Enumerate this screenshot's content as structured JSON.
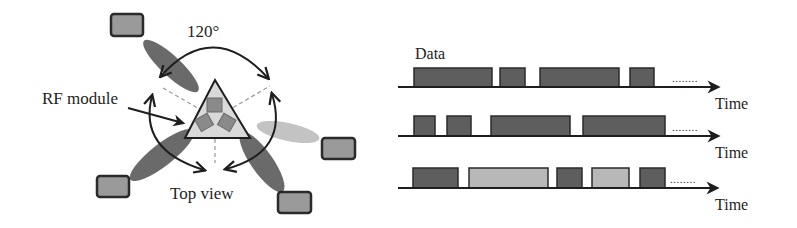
{
  "left_panel": {
    "angle_label": "120°",
    "rf_module_label": "RF module",
    "top_view_label": "Top view",
    "colors": {
      "beam_dark": "#5a5a5a",
      "beam_light": "#bdbdbd",
      "triangle_fill": "#d9d9d9",
      "module_fill": "#8a8a8a",
      "device_fill": "#9a9a9a",
      "stroke": "#1e1e1e"
    },
    "devices": [
      {
        "name": "top-left",
        "x": 111,
        "y": 14
      },
      {
        "name": "right",
        "x": 322,
        "y": 138
      },
      {
        "name": "bottom-left",
        "x": 97,
        "y": 176
      },
      {
        "name": "bottom-right",
        "x": 278,
        "y": 192
      }
    ]
  },
  "right_panel": {
    "data_label": "Data",
    "time_label": "Time",
    "continuation": "........",
    "colors": {
      "block_dark": "#5e5e5e",
      "block_light": "#b8b8b8",
      "axis": "#1e1e1e"
    },
    "timelines": [
      {
        "baseline_y": 87,
        "top_y": 68,
        "time_label": "Time",
        "blocks": [
          {
            "x1": 414,
            "x2": 492,
            "shade": "dark"
          },
          {
            "x1": 500,
            "x2": 525,
            "shade": "dark"
          },
          {
            "x1": 540,
            "x2": 619,
            "shade": "dark"
          },
          {
            "x1": 630,
            "x2": 654,
            "shade": "dark"
          }
        ]
      },
      {
        "baseline_y": 136,
        "top_y": 116,
        "time_label": "Time",
        "blocks": [
          {
            "x1": 414,
            "x2": 435,
            "shade": "dark"
          },
          {
            "x1": 447,
            "x2": 471,
            "shade": "dark"
          },
          {
            "x1": 491,
            "x2": 570,
            "shade": "dark"
          },
          {
            "x1": 583,
            "x2": 665,
            "shade": "dark"
          }
        ]
      },
      {
        "baseline_y": 188,
        "top_y": 168,
        "time_label": "Time",
        "blocks": [
          {
            "x1": 413,
            "x2": 458,
            "shade": "dark"
          },
          {
            "x1": 469,
            "x2": 548,
            "shade": "light"
          },
          {
            "x1": 557,
            "x2": 582,
            "shade": "dark"
          },
          {
            "x1": 592,
            "x2": 629,
            "shade": "light"
          },
          {
            "x1": 640,
            "x2": 665,
            "shade": "dark"
          }
        ]
      }
    ]
  }
}
